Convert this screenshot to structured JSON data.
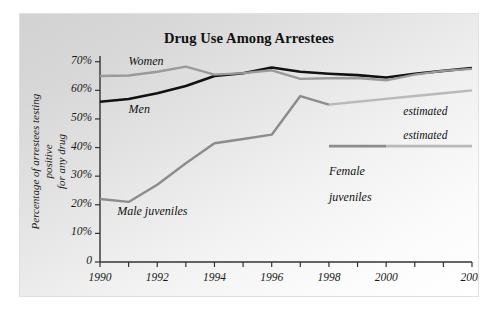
{
  "figure": {
    "background": "#ffffff",
    "panel_background": "#e8e8e8",
    "width": 491,
    "height": 312
  },
  "chart_data": {
    "type": "line",
    "title": "Drug Use Among Arrestees",
    "xlabel": "Year",
    "ylabel": "Percentage of arrestees testing positive\nfor any drug",
    "ylabel_line1": "Percentage of arrestees testing positive",
    "ylabel_line2": "for any drug",
    "xlim": [
      1990,
      2003
    ],
    "ylim": [
      0,
      72
    ],
    "grid": false,
    "legend_position": "inline-annotations",
    "x": [
      1990,
      1991,
      1992,
      1993,
      1994,
      1995,
      1996,
      1997,
      1998,
      1999,
      2000,
      2001,
      2002,
      2003
    ],
    "xticks": [
      1990,
      1991,
      1992,
      1993,
      1994,
      1995,
      1996,
      1997,
      1998,
      1999,
      2000,
      2001,
      2002,
      2003
    ],
    "xtick_labels": [
      "1990",
      "",
      "1992",
      "",
      "1994",
      "",
      "1996",
      "",
      "1998",
      "",
      "2000",
      "",
      "",
      "2003"
    ],
    "yticks": [
      0,
      10,
      20,
      30,
      40,
      50,
      60,
      70
    ],
    "ytick_labels": [
      "0",
      "10%",
      "20%",
      "30%",
      "40%",
      "50%",
      "60%",
      "70%"
    ],
    "series": [
      {
        "name": "Men",
        "color": "#111111",
        "width": 2.6,
        "label": "Men",
        "x": [
          1990,
          1991,
          1992,
          1993,
          1994,
          1995,
          1996,
          1997,
          1998,
          1999,
          2000,
          2001,
          2002,
          2003
        ],
        "values": [
          56.0,
          57.0,
          59.0,
          61.5,
          65.0,
          66.0,
          68.0,
          66.5,
          65.8,
          65.3,
          64.5,
          65.8,
          66.8,
          67.8
        ]
      },
      {
        "name": "Women",
        "color": "#9a9a9a",
        "width": 2.4,
        "label": "Women",
        "x": [
          1990,
          1991,
          1992,
          1993,
          1994,
          1995,
          1996,
          1997,
          1998,
          1999,
          2000,
          2001,
          2002,
          2003
        ],
        "values": [
          65.0,
          65.2,
          66.5,
          68.3,
          65.5,
          66.0,
          67.0,
          64.0,
          64.2,
          64.3,
          63.5,
          65.5,
          66.8,
          67.5
        ]
      },
      {
        "name": "Male juveniles",
        "color": "#8c8c8c",
        "width": 2.4,
        "label": "Male juveniles",
        "x": [
          1990,
          1991,
          1992,
          1993,
          1994,
          1995,
          1996,
          1997,
          1998,
          1999,
          2000,
          2001,
          2002,
          2003
        ],
        "values": [
          22.0,
          21.0,
          27.0,
          34.5,
          41.5,
          43.0,
          44.5,
          58.0,
          55.0,
          56.0,
          57.0,
          58.0,
          59.0,
          60.0
        ],
        "estimated_from": 1998,
        "estimated_label": "estimated"
      },
      {
        "name": "Female juveniles",
        "color": "#8c8c8c",
        "width": 2.6,
        "label": "Female\njuveniles",
        "label_line1": "Female",
        "label_line2": "juveniles",
        "x": [
          1998,
          1999,
          2000,
          2001,
          2002,
          2003
        ],
        "values": [
          40.5,
          40.5,
          40.5,
          40.5,
          40.5,
          40.5
        ],
        "estimated_from": 2000,
        "estimated_label": "estimated"
      }
    ],
    "annotations": [
      {
        "text": "Women",
        "x": 1991.0,
        "y": 70.0
      },
      {
        "text": "Men",
        "x": 1991.0,
        "y": 53.0
      },
      {
        "text": "Male juveniles",
        "x": 1990.6,
        "y": 17.5
      },
      {
        "text": "Female juveniles",
        "x": 1998.0,
        "y": 36.0
      },
      {
        "text": "estimated",
        "x": 2000.6,
        "y": 52.5
      },
      {
        "text": "estimated",
        "x": 2000.6,
        "y": 44.0
      }
    ]
  }
}
